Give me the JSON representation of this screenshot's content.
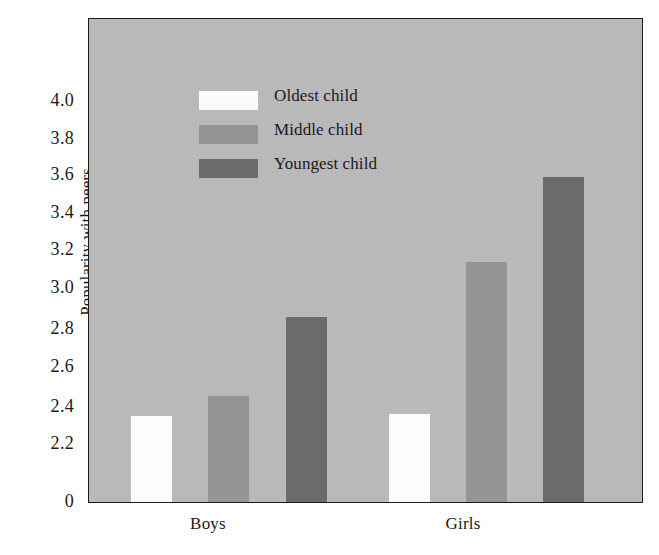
{
  "chart_data": {
    "type": "bar",
    "title": "",
    "xlabel": "",
    "ylabel": "Popularity with peers",
    "categories": [
      "Boys",
      "Girls"
    ],
    "series": [
      {
        "name": "Oldest child",
        "values": [
          2.34,
          2.35
        ],
        "color": "#fcfcfc"
      },
      {
        "name": "Middle child",
        "values": [
          2.45,
          3.14
        ],
        "color": "#959595"
      },
      {
        "name": "Youngest child",
        "values": [
          2.85,
          3.58
        ],
        "color": "#6b6b6b"
      }
    ],
    "ylim": [
      2.1,
      4.1
    ],
    "y_axis_break": true,
    "y_ticks": [
      "0",
      "2.2",
      "2.4",
      "2.6",
      "2.8",
      "3.0",
      "3.2",
      "3.4",
      "3.6",
      "3.8",
      "4.0"
    ],
    "y_tick_values": [
      null,
      2.2,
      2.4,
      2.6,
      2.8,
      3.0,
      3.2,
      3.4,
      3.6,
      3.8,
      4.0
    ],
    "grid": false,
    "legend_position": "upper left",
    "plot_background_color": "#b9b9b9",
    "figure_background_color": "#ffffff",
    "axis_color": "#1e1e1e"
  },
  "legend": {
    "items": [
      {
        "label": "Oldest child",
        "swatch": "white"
      },
      {
        "label": "Middle child",
        "swatch": "medium"
      },
      {
        "label": "Youngest child",
        "swatch": "dark"
      }
    ]
  },
  "axis": {
    "y_label": "Popularity with peers",
    "ticks": [
      {
        "text": "4.0",
        "y": 102
      },
      {
        "text": "3.8",
        "y": 140
      },
      {
        "text": "3.6",
        "y": 176
      },
      {
        "text": "3.4",
        "y": 214
      },
      {
        "text": "3.2",
        "y": 251
      },
      {
        "text": "3.0",
        "y": 289
      },
      {
        "text": "2.8",
        "y": 330
      },
      {
        "text": "2.6",
        "y": 368
      },
      {
        "text": "2.4",
        "y": 408
      },
      {
        "text": "2.2",
        "y": 445
      },
      {
        "text": "0",
        "y": 503
      }
    ]
  },
  "groups": [
    {
      "label": "Boys",
      "label_left": 148,
      "label_width": 120
    },
    {
      "label": "Girls",
      "label_left": 403,
      "label_width": 120
    }
  ],
  "bars": [
    {
      "group": "Boys",
      "series": "Oldest child",
      "value": 2.34,
      "swatch": "white",
      "left": 42,
      "width": 41,
      "height": 86
    },
    {
      "group": "Boys",
      "series": "Middle child",
      "value": 2.45,
      "swatch": "medium",
      "left": 119,
      "width": 41,
      "height": 106
    },
    {
      "group": "Boys",
      "series": "Youngest child",
      "value": 2.85,
      "swatch": "dark",
      "left": 197,
      "width": 41,
      "height": 185
    },
    {
      "group": "Girls",
      "series": "Oldest child",
      "value": 2.35,
      "swatch": "white",
      "left": 300,
      "width": 41,
      "height": 88
    },
    {
      "group": "Girls",
      "series": "Middle child",
      "value": 3.14,
      "swatch": "medium",
      "left": 377,
      "width": 41,
      "height": 240
    },
    {
      "group": "Girls",
      "series": "Youngest child",
      "value": 3.58,
      "swatch": "dark",
      "left": 454,
      "width": 41,
      "height": 325
    }
  ]
}
